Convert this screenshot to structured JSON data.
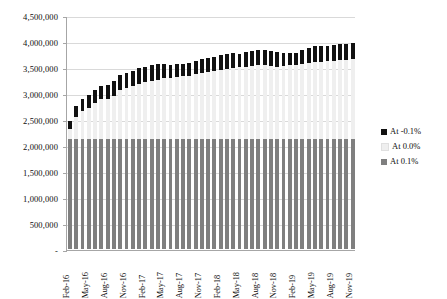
{
  "chart_data": {
    "type": "bar",
    "stacked": true,
    "title": "",
    "subtitle": "",
    "xlabel": "",
    "ylabel": "",
    "ylim": [
      0,
      4500000
    ],
    "ytick_values": [
      0,
      500000,
      1000000,
      1500000,
      2000000,
      2500000,
      3000000,
      3500000,
      4000000,
      4500000
    ],
    "ytick_labels": [
      "-",
      "500,000",
      "1,000,000",
      "1,500,000",
      "2,000,000",
      "2,500,000",
      "3,000,000",
      "3,500,000",
      "4,000,000",
      "4,500,000"
    ],
    "grid": true,
    "legend_position": "right",
    "categories": [
      "Feb-16",
      "Mar-16",
      "Apr-16",
      "May-16",
      "Jun-16",
      "Jul-16",
      "Aug-16",
      "Sep-16",
      "Oct-16",
      "Nov-16",
      "Dec-16",
      "Jan-17",
      "Feb-17",
      "Mar-17",
      "Apr-17",
      "May-17",
      "Jun-17",
      "Jul-17",
      "Aug-17",
      "Sep-17",
      "Oct-17",
      "Nov-17",
      "Dec-17",
      "Jan-18",
      "Feb-18",
      "Mar-18",
      "Apr-18",
      "May-18",
      "Jun-18",
      "Jul-18",
      "Aug-18",
      "Sep-18",
      "Oct-18",
      "Nov-18",
      "Dec-18",
      "Jan-19",
      "Feb-19",
      "Mar-19",
      "Apr-19",
      "May-19",
      "Jun-19",
      "Jul-19",
      "Aug-19",
      "Sep-19",
      "Oct-19",
      "Nov-19"
    ],
    "xtick_labels": [
      "Feb-16",
      "May-16",
      "Aug-16",
      "Nov-16",
      "Feb-17",
      "May-17",
      "Aug-17",
      "Nov-17",
      "Feb-18",
      "May-18",
      "Aug-18",
      "Nov-18",
      "Feb-19",
      "May-19",
      "Aug-19",
      "Nov-19"
    ],
    "series": [
      {
        "name": "At 0.1%",
        "color": "#7f7f7f",
        "values": [
          2120000,
          2120000,
          2120000,
          2120000,
          2120000,
          2120000,
          2120000,
          2120000,
          2120000,
          2120000,
          2120000,
          2120000,
          2120000,
          2120000,
          2120000,
          2120000,
          2120000,
          2120000,
          2120000,
          2120000,
          2120000,
          2120000,
          2120000,
          2120000,
          2120000,
          2120000,
          2120000,
          2120000,
          2120000,
          2120000,
          2120000,
          2120000,
          2120000,
          2120000,
          2120000,
          2120000,
          2120000,
          2120000,
          2120000,
          2120000,
          2120000,
          2120000,
          2120000,
          2120000,
          2120000,
          2120000
        ]
      },
      {
        "name": "At 0.0%",
        "color": "#efefef",
        "values": [
          180000,
          420000,
          530000,
          600000,
          690000,
          760000,
          760000,
          830000,
          930000,
          980000,
          1010000,
          1060000,
          1090000,
          1120000,
          1140000,
          1160000,
          1170000,
          1190000,
          1200000,
          1210000,
          1240000,
          1270000,
          1290000,
          1300000,
          1320000,
          1350000,
          1360000,
          1380000,
          1390000,
          1400000,
          1410000,
          1420000,
          1400000,
          1390000,
          1400000,
          1410000,
          1420000,
          1430000,
          1450000,
          1470000,
          1480000,
          1490000,
          1500000,
          1510000,
          1520000,
          1530000
        ]
      },
      {
        "name": "At -0.1%",
        "color": "#111111",
        "values": [
          170000,
          220000,
          230000,
          250000,
          250000,
          260000,
          270000,
          280000,
          290000,
          290000,
          290000,
          300000,
          300000,
          300000,
          300000,
          280000,
          250000,
          240000,
          230000,
          240000,
          250000,
          260000,
          270000,
          280000,
          290000,
          290000,
          290000,
          260000,
          280000,
          290000,
          290000,
          280000,
          290000,
          270000,
          250000,
          240000,
          230000,
          280000,
          300000,
          310000,
          310000,
          300000,
          300000,
          310000,
          310000,
          320000
        ]
      }
    ],
    "legend": [
      {
        "label": "At -0.1%",
        "color": "#111111"
      },
      {
        "label": "At 0.0%",
        "color": "#efefef"
      },
      {
        "label": "At 0.1%",
        "color": "#7f7f7f"
      }
    ]
  }
}
